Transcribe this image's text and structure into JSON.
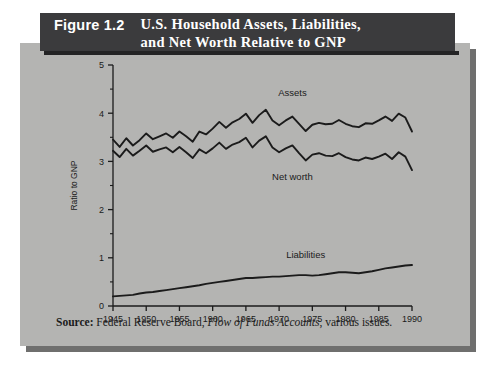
{
  "figure": {
    "number": "Figure 1.2",
    "title_line1": "U.S. Household Assets, Liabilities,",
    "title_line2": "and Net Worth Relative to GNP",
    "source_prefix": "Source:",
    "source_org": "Federal Reserve Board,",
    "source_publication": "Flow of Funds Accounts",
    "source_suffix": ", various issues.",
    "banner_color": "#3b3b3d",
    "panel_color": "#b4b4b2",
    "line_color": "#1b1b1b"
  },
  "chart_data": {
    "type": "line",
    "title": "U.S. Household Assets, Liabilities, and Net Worth Relative to GNP",
    "xlabel": "",
    "ylabel": "Ratio to GNP",
    "xlim": [
      1945,
      1990
    ],
    "ylim": [
      0,
      5
    ],
    "xticks": [
      1945,
      1950,
      1955,
      1960,
      1965,
      1970,
      1975,
      1980,
      1985,
      1990
    ],
    "yticks": [
      0,
      1,
      2,
      3,
      4,
      5
    ],
    "minor_yticks": [
      0.5,
      1.5,
      2.5,
      3.5,
      4.5
    ],
    "grid": false,
    "legend": "inline-annotations",
    "x": [
      1945,
      1946,
      1947,
      1948,
      1949,
      1950,
      1951,
      1952,
      1953,
      1954,
      1955,
      1956,
      1957,
      1958,
      1959,
      1960,
      1961,
      1962,
      1963,
      1964,
      1965,
      1966,
      1967,
      1968,
      1969,
      1970,
      1971,
      1972,
      1973,
      1974,
      1975,
      1976,
      1977,
      1978,
      1979,
      1980,
      1981,
      1982,
      1983,
      1984,
      1985,
      1986,
      1987,
      1988,
      1989,
      1990
    ],
    "series": [
      {
        "name": "Assets",
        "label_x": 1972,
        "label_y": 4.35,
        "values": [
          3.45,
          3.3,
          3.48,
          3.33,
          3.44,
          3.58,
          3.46,
          3.52,
          3.58,
          3.49,
          3.62,
          3.52,
          3.41,
          3.62,
          3.56,
          3.68,
          3.82,
          3.7,
          3.81,
          3.88,
          3.99,
          3.8,
          3.96,
          4.07,
          3.85,
          3.75,
          3.85,
          3.93,
          3.78,
          3.63,
          3.76,
          3.8,
          3.77,
          3.78,
          3.86,
          3.78,
          3.73,
          3.71,
          3.79,
          3.78,
          3.85,
          3.93,
          3.84,
          3.99,
          3.91,
          3.62
        ]
      },
      {
        "name": "Net worth",
        "label_x": 1972,
        "label_y": 2.62,
        "values": [
          3.22,
          3.09,
          3.26,
          3.12,
          3.22,
          3.33,
          3.2,
          3.25,
          3.29,
          3.19,
          3.3,
          3.19,
          3.07,
          3.25,
          3.17,
          3.27,
          3.39,
          3.26,
          3.35,
          3.4,
          3.49,
          3.29,
          3.43,
          3.52,
          3.29,
          3.19,
          3.27,
          3.33,
          3.17,
          3.02,
          3.14,
          3.17,
          3.12,
          3.11,
          3.17,
          3.09,
          3.04,
          3.02,
          3.08,
          3.05,
          3.1,
          3.16,
          3.05,
          3.19,
          3.1,
          2.82
        ]
      },
      {
        "name": "Liabilities",
        "label_x": 1974,
        "label_y": 1.0,
        "values": [
          0.2,
          0.21,
          0.22,
          0.23,
          0.26,
          0.28,
          0.29,
          0.31,
          0.33,
          0.35,
          0.37,
          0.39,
          0.41,
          0.43,
          0.46,
          0.48,
          0.5,
          0.52,
          0.54,
          0.56,
          0.58,
          0.58,
          0.59,
          0.6,
          0.61,
          0.61,
          0.62,
          0.63,
          0.64,
          0.64,
          0.63,
          0.64,
          0.66,
          0.68,
          0.7,
          0.7,
          0.69,
          0.68,
          0.7,
          0.72,
          0.75,
          0.78,
          0.8,
          0.82,
          0.84,
          0.85
        ]
      }
    ]
  }
}
